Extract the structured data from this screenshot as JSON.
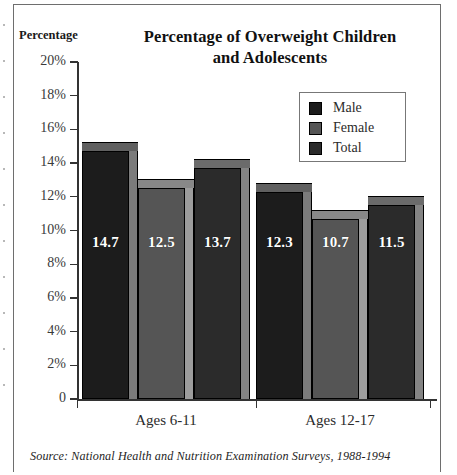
{
  "chart_data": {
    "type": "bar",
    "title": "Percentage of Overweight Children and Adolescents",
    "title_line1": "Percentage of Overweight Children",
    "title_line2": "and Adolescents",
    "ylabel": "Percentage",
    "xlabel": "",
    "ylim": [
      0,
      20
    ],
    "grid": false,
    "legend_position": "upper-right",
    "ytick_labels": [
      "0",
      "2%",
      "4%",
      "6%",
      "8%",
      "10%",
      "12%",
      "14%",
      "16%",
      "18%",
      "20%"
    ],
    "ytick_values": [
      0,
      2,
      4,
      6,
      8,
      10,
      12,
      14,
      16,
      18,
      20
    ],
    "categories": [
      "Ages 6-11",
      "Ages 12-17"
    ],
    "series": [
      {
        "name": "Male",
        "values": [
          14.7,
          12.3
        ],
        "color": "#1c1c1c"
      },
      {
        "name": "Female",
        "values": [
          12.5,
          10.7
        ],
        "color": "#555555"
      },
      {
        "name": "Total",
        "values": [
          13.7,
          11.5
        ],
        "color": "#2b2b2b"
      }
    ],
    "data_labels": [
      [
        "14.7",
        "12.5",
        "13.7"
      ],
      [
        "12.3",
        "10.7",
        "11.5"
      ]
    ],
    "source": "Source: National Health and Nutrition Examination Surveys, 1988-1994"
  },
  "legend": {
    "items": [
      {
        "label": "Male"
      },
      {
        "label": "Female"
      },
      {
        "label": "Total"
      }
    ]
  }
}
